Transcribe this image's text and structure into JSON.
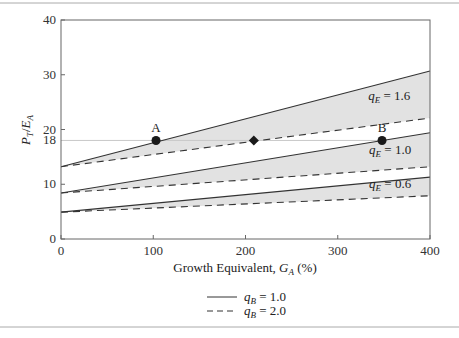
{
  "chart_data": {
    "type": "line",
    "title": "",
    "xlabel": "Growth Equivalent, ",
    "xlabel_var": "G",
    "xlabel_sub": "A",
    "xlabel_unit": " (%)",
    "ylabel_num": "P",
    "ylabel_num_sub": "T",
    "ylabel_den": "E",
    "ylabel_den_sub": "A",
    "xlim": [
      0,
      400
    ],
    "ylim": [
      0,
      40
    ],
    "xticks": [
      0,
      100,
      200,
      300,
      400
    ],
    "xtick_labels": [
      "0",
      "100",
      "200",
      "300",
      "400"
    ],
    "yticks": [
      0,
      10,
      18,
      20,
      30,
      40
    ],
    "ytick_labels": [
      "0",
      "10",
      "18",
      "20",
      "30",
      "40"
    ],
    "grid": false,
    "reference_line_y": 18,
    "bands": [
      {
        "qE": "1.6",
        "label": "= 1.6",
        "solid": [
          [
            0,
            13.2
          ],
          [
            400,
            30.7
          ]
        ],
        "dashed": [
          [
            0,
            13.2
          ],
          [
            400,
            22.1
          ]
        ]
      },
      {
        "qE": "1.0",
        "label": "= 1.0",
        "solid": [
          [
            0,
            8.4
          ],
          [
            400,
            19.4
          ]
        ],
        "dashed": [
          [
            0,
            8.4
          ],
          [
            400,
            13.2
          ]
        ]
      },
      {
        "qE": "0.6",
        "label": "= 0.6",
        "solid": [
          [
            0,
            4.9
          ],
          [
            400,
            11.3
          ]
        ],
        "dashed": [
          [
            0,
            4.9
          ],
          [
            400,
            7.9
          ]
        ]
      }
    ],
    "band_label_positions": [
      {
        "x": 333,
        "y": 25.3
      },
      {
        "x": 334,
        "y": 15.5
      },
      {
        "x": 334,
        "y": 9.3
      }
    ],
    "points": [
      {
        "label": "A",
        "x": 103,
        "y": 18,
        "marker": "circle"
      },
      {
        "label": "",
        "x": 209,
        "y": 18,
        "marker": "diamond"
      },
      {
        "label": "B",
        "x": 348,
        "y": 18,
        "marker": "circle"
      }
    ],
    "legend": {
      "placement": "bottom-center",
      "entries": [
        {
          "style": "solid",
          "var": "q",
          "sub": "B",
          "text": " = 1.0"
        },
        {
          "style": "dashed",
          "var": "q",
          "sub": "B",
          "text": " = 2.0"
        }
      ]
    },
    "colors": {
      "line": "#333333",
      "fill": "#e2e2e2",
      "ref": "#c8c8c8",
      "marker": "#1a1a1a"
    }
  }
}
